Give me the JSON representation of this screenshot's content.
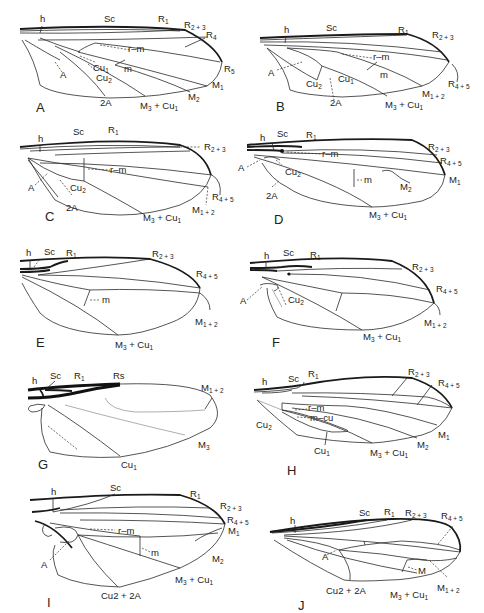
{
  "figure": {
    "panels": [
      {
        "id": "A",
        "letter": "A",
        "labels": {
          "h": "h",
          "Sc": "Sc",
          "R1": "R1",
          "R23": "R2 + 3",
          "R4": "R4",
          "R5": "R5",
          "rm": "r–m",
          "Cu1": "Cu1",
          "Cu2": "Cu2",
          "m": "m",
          "A": "A",
          "A2": "2A",
          "M3Cu1": "M3 + Cu1",
          "M2": "M2",
          "M1": "M1"
        }
      },
      {
        "id": "B",
        "letter": "B",
        "labels": {
          "h": "h",
          "Sc": "Sc",
          "R1": "R1",
          "R23": "R2 + 3",
          "rm": "r–m",
          "A": "A",
          "m": "m",
          "Cu2": "Cu2",
          "Cu1": "Cu1",
          "R45": "R4 + 5",
          "M12": "M1 + 2",
          "A2": "2A",
          "M3Cu1": "M3 + Cu1"
        }
      },
      {
        "id": "C",
        "letter": "C",
        "labels": {
          "h": "h",
          "Sc": "Sc",
          "R1": "R1",
          "R23": "R2 + 3",
          "rm": "r–m",
          "A": "A",
          "Cu2": "Cu2",
          "A2": "2A",
          "R45": "R4 + 5",
          "M12": "M1 + 2",
          "M3Cu1": "M3 + Cu1"
        }
      },
      {
        "id": "D",
        "letter": "D",
        "labels": {
          "h": "h",
          "Sc": "Sc",
          "R1": "R1",
          "R23": "R2 + 3",
          "R45": "R4 + 5",
          "rm": "r–m",
          "A": "A",
          "Cu2": "Cu2",
          "m": "m",
          "M2": "M2",
          "M1": "M1",
          "A2": "2A",
          "M3Cu1": "M3 + Cu1"
        }
      },
      {
        "id": "E",
        "letter": "E",
        "labels": {
          "h": "h",
          "Sc": "Sc",
          "R1": "R1",
          "R23": "R2 + 3",
          "R45": "R4 + 5",
          "m": "m",
          "M12": "M1 + 2",
          "M3Cu1": "M3 + Cu1"
        }
      },
      {
        "id": "F",
        "letter": "F",
        "labels": {
          "h": "h",
          "Sc": "Sc",
          "R1": "R1",
          "R23": "R2 + 3",
          "R45": "R4 + 5",
          "A": "A",
          "Cu2": "Cu2",
          "M12": "M1 + 2",
          "M3Cu1": "M3 + Cu1"
        }
      },
      {
        "id": "G",
        "letter": "G",
        "labels": {
          "h": "h",
          "Sc": "Sc",
          "R1": "R1",
          "Rs": "Rs",
          "M12": "M1 + 2",
          "M3": "M3",
          "Cu1": "Cu1"
        }
      },
      {
        "id": "H",
        "letter": "H",
        "labels": {
          "h": "h",
          "Sc": "Sc",
          "R1": "R1",
          "R23": "R2 + 3",
          "R45": "R4 + 5",
          "rm": "r–m",
          "mcu": "m–cu",
          "Cu2": "Cu2",
          "M1": "M1",
          "M2": "M2",
          "Cu1": "Cu1",
          "M3Cu1": "M3 + Cu1"
        }
      },
      {
        "id": "I",
        "letter": "I",
        "labels": {
          "h": "h",
          "Sc": "Sc",
          "R1": "R1",
          "R23": "R2 + 3",
          "R45": "R4 + 5",
          "M1": "M1",
          "rm": "r–m",
          "m": "m",
          "M2": "M2",
          "A": "A",
          "M3Cu1": "M3 + Cu1",
          "Cu2A2": "Cu2 + 2A"
        }
      },
      {
        "id": "J",
        "letter": "J",
        "labels": {
          "h": "h",
          "Sc": "Sc",
          "R1": "R1",
          "R23": "R2 + 3",
          "R45": "R4 + 5",
          "A": "A",
          "M": "M",
          "M12": "M1 + 2",
          "Cu2A2": "Cu2 + 2A",
          "M3Cu1": "M3 + Cu1"
        }
      }
    ]
  }
}
